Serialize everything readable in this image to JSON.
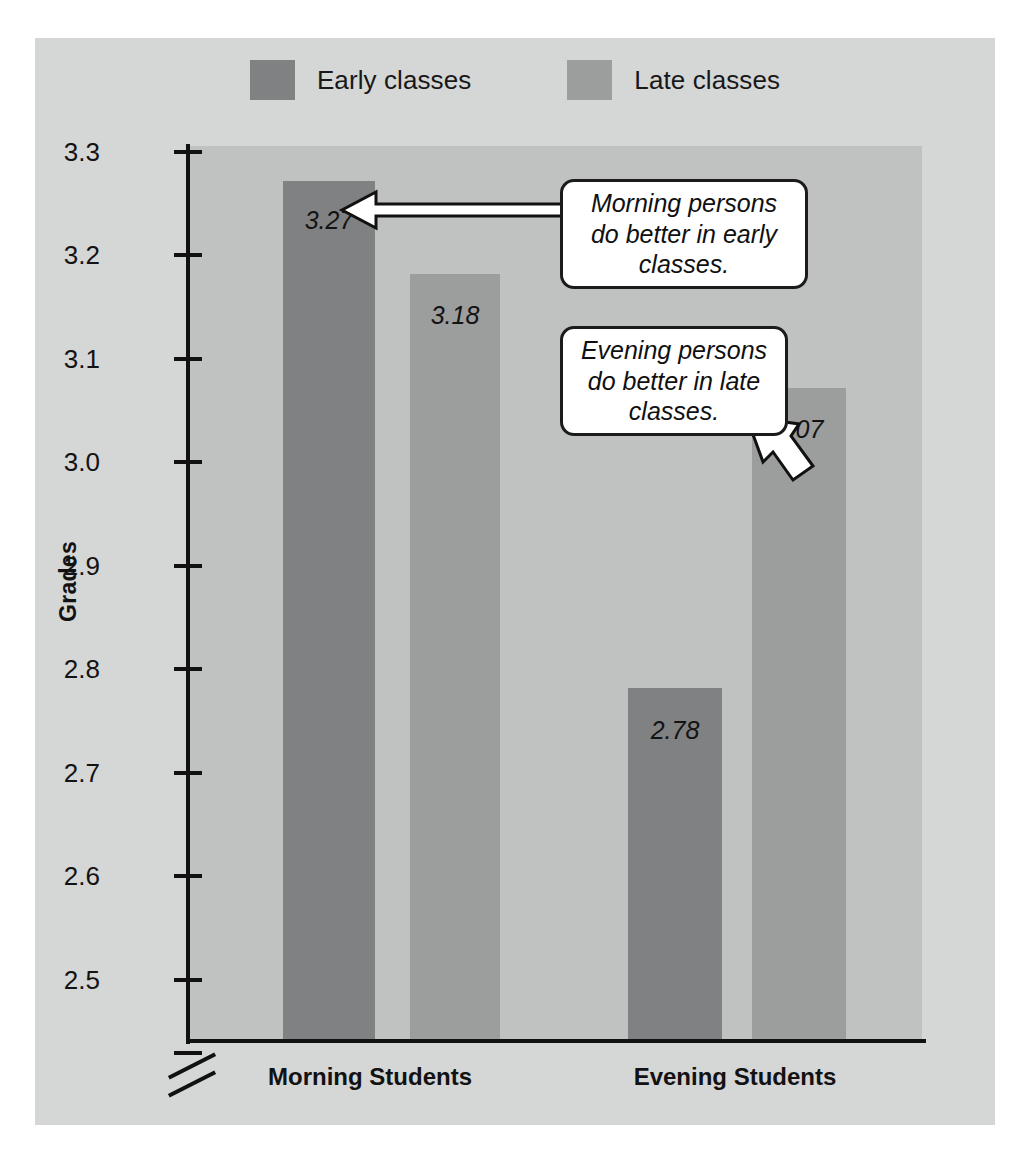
{
  "chart_data": {
    "type": "bar",
    "title": "",
    "subtitle": "",
    "xlabel": "",
    "ylabel": "Grades",
    "categories": [
      "Morning Students",
      "Evening Students"
    ],
    "series": [
      {
        "name": "Early classes",
        "color": "#808182",
        "values": [
          3.27,
          2.78
        ],
        "labels": [
          "3.27",
          "2.78"
        ]
      },
      {
        "name": "Late classes",
        "color": "#9c9d9d",
        "values": [
          3.18,
          3.07
        ],
        "labels": [
          "3.18",
          "3.07"
        ]
      }
    ],
    "ylim": [
      2.44,
      3.3
    ],
    "y_ticks": [
      "3.3",
      "3.2",
      "3.1",
      "3.0",
      "2.9",
      "2.8",
      "2.7",
      "2.6",
      "2.5"
    ],
    "y_tick_values": [
      3.3,
      3.2,
      3.1,
      3.0,
      2.9,
      2.8,
      2.7,
      2.6,
      2.5
    ],
    "axis_break": true,
    "grid": false,
    "legend_position": "top-center",
    "annotations": [
      {
        "text": "Morning persons do better in early classes.",
        "points_to": "Morning Students / Early classes (3.27)"
      },
      {
        "text": "Evening persons do better in late classes.",
        "points_to": "Evening Students / Late classes (3.07)"
      }
    ]
  },
  "legend": {
    "entries": [
      {
        "label": "Early classes",
        "color": "#808182"
      },
      {
        "label": "Late classes",
        "color": "#9c9d9d"
      }
    ]
  },
  "axis": {
    "y_title": "Grades",
    "ticks": [
      {
        "label": "3.3"
      },
      {
        "label": "3.2"
      },
      {
        "label": "3.1"
      },
      {
        "label": "3.0"
      },
      {
        "label": "2.9"
      },
      {
        "label": "2.8"
      },
      {
        "label": "2.7"
      },
      {
        "label": "2.6"
      },
      {
        "label": "2.5"
      }
    ]
  },
  "categories": [
    {
      "label": "Morning Students"
    },
    {
      "label": "Evening Students"
    }
  ],
  "bars": [
    {
      "name": "morning-early",
      "value": 3.27,
      "label": "3.27",
      "series": "Early classes",
      "group": "Morning Students"
    },
    {
      "name": "morning-late",
      "value": 3.18,
      "label": "3.18",
      "series": "Late classes",
      "group": "Morning Students"
    },
    {
      "name": "evening-early",
      "value": 2.78,
      "label": "2.78",
      "series": "Early classes",
      "group": "Evening Students"
    },
    {
      "name": "evening-late",
      "value": 3.07,
      "label": "3.07",
      "series": "Late classes",
      "group": "Evening Students"
    }
  ],
  "callouts": [
    {
      "name": "morning-callout",
      "line1": "Morning persons",
      "line2": "do better in early",
      "line3": "classes."
    },
    {
      "name": "evening-callout",
      "line1": "Evening persons",
      "line2": "do better in late",
      "line3": "classes."
    }
  ],
  "colors": {
    "early_classes": "#808182",
    "late_classes": "#9c9d9d",
    "plot_background": "#c0c1c1",
    "figure_background": "#d5d6d6",
    "axis": "#111111",
    "callout_fill": "#ffffff",
    "callout_border": "#1b1b1b"
  }
}
